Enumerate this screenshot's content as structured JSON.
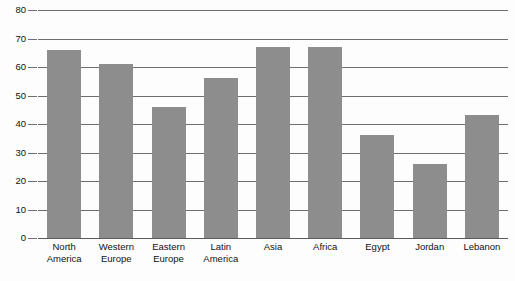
{
  "chart_data": {
    "type": "bar",
    "title": "",
    "subtitle": "",
    "xlabel": "",
    "ylabel": "",
    "ylim": [
      0,
      80
    ],
    "yticks": [
      0,
      10,
      20,
      30,
      40,
      50,
      60,
      70,
      80
    ],
    "grid": true,
    "legend": false,
    "legend_position": "none",
    "bar_color": "#8d8d8d",
    "grid_color": "#6f6f6f",
    "background_color": "#fdfdfd",
    "categories": [
      "North America",
      "Western Europe",
      "Eastern Europe",
      "Latin America",
      "Asia",
      "Africa",
      "Egypt",
      "Jordan",
      "Lebanon"
    ],
    "category_lines": [
      [
        "North",
        "America"
      ],
      [
        "Western",
        "Europe"
      ],
      [
        "Eastern",
        "Europe"
      ],
      [
        "Latin",
        "America"
      ],
      [
        "Asia"
      ],
      [
        "Africa"
      ],
      [
        "Egypt"
      ],
      [
        "Jordan"
      ],
      [
        "Lebanon"
      ]
    ],
    "values": [
      66,
      61,
      46,
      56,
      67,
      67,
      36,
      26,
      43
    ]
  }
}
